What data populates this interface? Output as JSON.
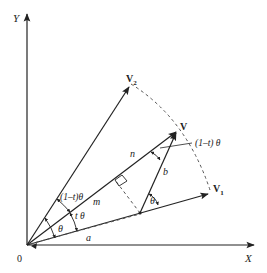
{
  "diagram": {
    "type": "vector-geometry",
    "axes": {
      "x_label": "X",
      "y_label": "Y",
      "origin_label": "0"
    },
    "vectors": {
      "v1": {
        "label": "V",
        "subscript": "1"
      },
      "v2": {
        "label": "V",
        "subscript": "2"
      },
      "v": {
        "label": "V"
      }
    },
    "segment_labels": {
      "m": "m",
      "n": "n",
      "a": "a",
      "b": "b"
    },
    "angle_labels": {
      "one_minus_t_theta_outer": "(1–t) θ",
      "one_minus_t_theta_inner": "(1–t)θ",
      "t_theta": "t θ",
      "theta_origin": "θ",
      "theta_at_foot": "θ"
    },
    "colors": {
      "line": "#222222",
      "dashed": "#555555",
      "background": "#ffffff"
    }
  }
}
